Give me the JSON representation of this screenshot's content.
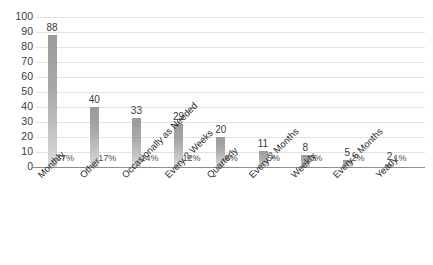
{
  "chart_data": {
    "type": "bar",
    "title": "",
    "xlabel": "",
    "ylabel": "",
    "ylim": [
      0,
      100
    ],
    "ytick_step": 10,
    "yticks": [
      "100",
      "90",
      "80",
      "70",
      "60",
      "50",
      "40",
      "30",
      "20",
      "10",
      "0"
    ],
    "grid": true,
    "legend": "none",
    "bar_color": "#a8a8a8",
    "categories": [
      "Monthly",
      "Other",
      "Occasionally as Needed",
      "Every 2 Weeks",
      "Quarterly",
      "Every 2 Months",
      "Weekly",
      "Every 6 Months",
      "Yearly"
    ],
    "values": [
      88,
      40,
      33,
      29,
      20,
      11,
      8,
      5,
      2
    ],
    "value_labels": [
      "88",
      "40",
      "33",
      "29",
      "20",
      "11",
      "8",
      "5",
      "2"
    ],
    "percent_labels": [
      "37%",
      "17%",
      "14%",
      "12%",
      "8%",
      "5%",
      "3%",
      "2%",
      "1%"
    ]
  }
}
